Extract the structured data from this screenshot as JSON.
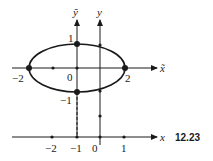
{
  "figure_label": "12.23",
  "axes": {
    "x_tilde": "x̃",
    "y_tilde": "ỹ",
    "x": "x",
    "y": "y"
  },
  "tilde_frame_labels": {
    "origin": "0",
    "left_vertex": "−2",
    "right_vertex": "2",
    "top_vertex": "1",
    "bottom_vertex": "−1"
  },
  "x_axis_ticks": [
    "−2",
    "−1",
    "0",
    "1"
  ],
  "colors": {
    "ink": "#1a1a1a",
    "background": "#ffffff"
  }
}
